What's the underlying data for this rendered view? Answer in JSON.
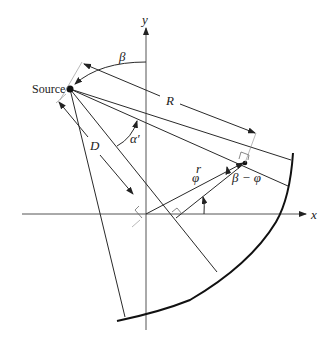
{
  "diagram": {
    "labels": {
      "source": "Source",
      "x_axis": "x",
      "y_axis": "y",
      "beta": "β",
      "R": "R",
      "D": "D",
      "alpha_prime": "α′",
      "r": "r",
      "phi": "φ",
      "beta_minus_phi": "β − φ"
    },
    "elements": [
      "x-axis",
      "y-axis",
      "source-point",
      "object-point",
      "detector-arc",
      "central-ray",
      "ray-through-point",
      "fan-edge-rays",
      "R-dimension",
      "D-dimension",
      "beta-angle-arc",
      "alpha-prime-angle-arc",
      "phi-angle-arc",
      "right-angle-markers"
    ]
  }
}
